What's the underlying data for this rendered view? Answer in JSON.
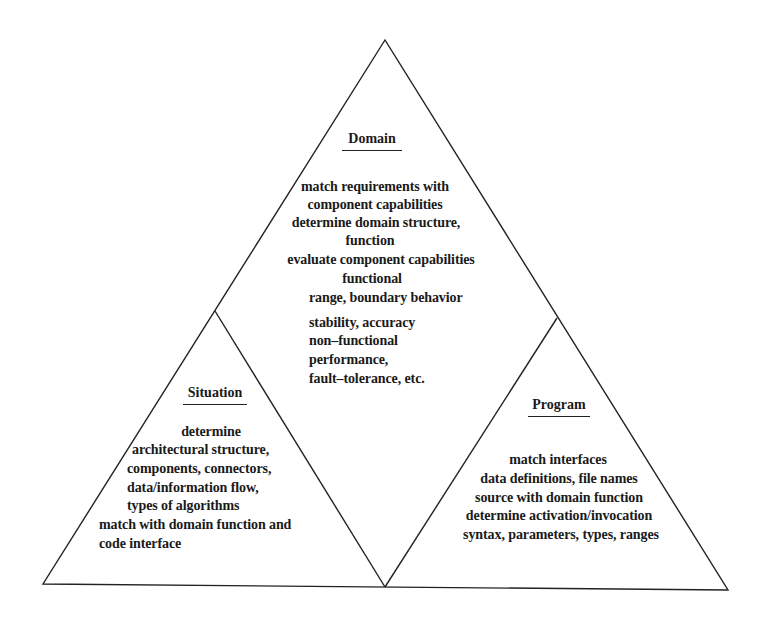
{
  "diagram": {
    "type": "triangle-of-triangles",
    "line_color": "#222222",
    "background": "#ffffff",
    "sections": {
      "domain": {
        "title": "Domain",
        "lines": [
          "match requirements with",
          "component capabilities",
          "determine domain structure,",
          "function",
          "evaluate component capabilities",
          "functional",
          "range, boundary behavior",
          "stability, accuracy",
          "non–functional",
          "performance,",
          "fault–tolerance, etc."
        ]
      },
      "situation": {
        "title": "Situation",
        "lines": [
          "determine",
          "architectural structure,",
          "components, connectors,",
          "data/information flow,",
          "types of algorithms",
          "match with domain function and",
          "code interface"
        ]
      },
      "program": {
        "title": "Program",
        "lines": [
          "match interfaces",
          "data definitions, file names",
          "source with domain function",
          "determine activation/invocation",
          "syntax, parameters, types, ranges"
        ]
      }
    }
  }
}
